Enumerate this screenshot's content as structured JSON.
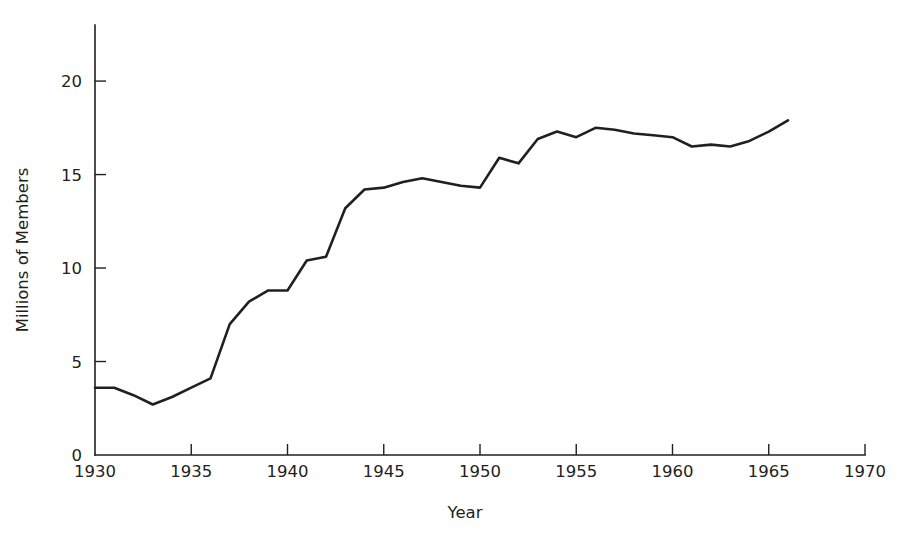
{
  "chart_data": {
    "type": "line",
    "title": "",
    "xlabel": "Year",
    "ylabel": "Millions of Members",
    "xlim": [
      1930,
      1970
    ],
    "ylim": [
      0,
      23
    ],
    "grid": false,
    "legend": "none",
    "xticks": [
      1930,
      1935,
      1940,
      1945,
      1950,
      1955,
      1960,
      1965,
      1970
    ],
    "xtick_labels": [
      "1930",
      "1935",
      "1940",
      "1945",
      "1950",
      "1955",
      "1960",
      "1965",
      "1970"
    ],
    "yticks": [
      0,
      5,
      10,
      15,
      20
    ],
    "ytick_labels": [
      "0",
      "5",
      "10",
      "15",
      "20"
    ],
    "tick_direction": "in",
    "line_color": "#231f20",
    "background_color": "#ffffff",
    "series": [
      {
        "name": "Union membership",
        "x": [
          1930,
          1931,
          1932,
          1933,
          1934,
          1935,
          1936,
          1937,
          1938,
          1939,
          1940,
          1941,
          1942,
          1943,
          1944,
          1945,
          1946,
          1947,
          1948,
          1949,
          1950,
          1951,
          1952,
          1953,
          1954,
          1955,
          1956,
          1957,
          1958,
          1959,
          1960,
          1961,
          1962,
          1963,
          1964,
          1965,
          1966
        ],
        "y": [
          3.6,
          3.6,
          3.2,
          2.7,
          3.1,
          3.6,
          4.1,
          7.0,
          8.2,
          8.8,
          8.8,
          10.4,
          10.6,
          13.2,
          14.2,
          14.3,
          14.6,
          14.8,
          14.6,
          14.4,
          14.3,
          15.9,
          15.6,
          16.9,
          17.3,
          17.0,
          17.5,
          17.4,
          17.2,
          17.1,
          17.0,
          16.5,
          16.6,
          16.5,
          16.8,
          17.3,
          17.9
        ]
      }
    ]
  },
  "geometry": {
    "plot_left": 95,
    "plot_bottom": 455,
    "plot_right": 865,
    "axis_top": 25
  }
}
